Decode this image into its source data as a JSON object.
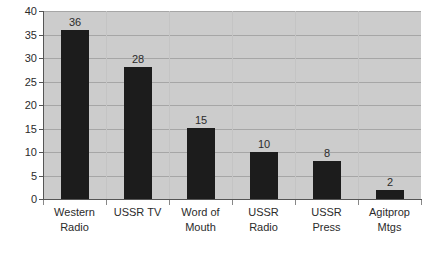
{
  "chart_data": {
    "type": "bar",
    "title": "",
    "subtitle": "",
    "xlabel": "",
    "ylabel": "",
    "categories": [
      "Western Radio",
      "USSR TV",
      "Word of Mouth",
      "USSR Radio",
      "USSR Press",
      "Agitprop Mtgs"
    ],
    "category_lines": [
      [
        "Western",
        "Radio"
      ],
      [
        "USSR TV",
        ""
      ],
      [
        "Word of",
        "Mouth"
      ],
      [
        "USSR",
        "Radio"
      ],
      [
        "USSR",
        "Press"
      ],
      [
        "Agitprop",
        "Mtgs"
      ]
    ],
    "values": [
      36,
      28,
      15,
      10,
      8,
      2
    ],
    "data_labels": [
      "36",
      "28",
      "15",
      "10",
      "8",
      "2"
    ],
    "ylim": [
      0,
      40
    ],
    "ytick_values": [
      0,
      5,
      10,
      15,
      20,
      25,
      30,
      35,
      40
    ],
    "ytick_labels": [
      "0",
      "5",
      "10",
      "15",
      "20",
      "25",
      "30",
      "35",
      "40"
    ],
    "grid": true,
    "grid_axis": "y",
    "legend": false,
    "legend_position": "none",
    "colors": {
      "bar": "#1c1c1c",
      "plot_background": "#cccccc",
      "figure_background": "#ffffff",
      "gridline": "#a6a6a6",
      "axis": "#555555",
      "text": "#2b2b2b"
    }
  }
}
